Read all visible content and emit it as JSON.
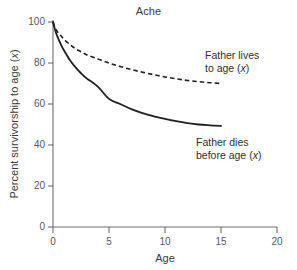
{
  "chart_data": {
    "type": "line",
    "title": "Ache",
    "xlabel": "Age",
    "ylabel": "Percent survivorship to age (x)",
    "xlim": [
      0,
      20
    ],
    "ylim": [
      0,
      100
    ],
    "xticks": [
      0,
      5,
      10,
      15,
      20
    ],
    "yticks": [
      0,
      20,
      40,
      60,
      80,
      100
    ],
    "xtick_labels": [
      "0",
      "5",
      "10",
      "15",
      "20"
    ],
    "ytick_labels": [
      "0",
      "20",
      "40",
      "60",
      "80",
      "100"
    ],
    "grid": false,
    "legend_position": "inline-annotations",
    "series": [
      {
        "name": "Father lives to age (x)",
        "style": "dashed",
        "color": "#231f20",
        "x": [
          0,
          0.25,
          0.5,
          0.75,
          1,
          1.5,
          2,
          2.5,
          3,
          4,
          5,
          6,
          7,
          8,
          9,
          10,
          11,
          12,
          13,
          14,
          15
        ],
        "values": [
          100,
          96.5,
          94.5,
          93,
          91.5,
          89,
          87,
          85.5,
          84,
          82,
          80,
          78.3,
          76.8,
          75.5,
          74.3,
          73.2,
          72.3,
          71.5,
          70.9,
          70.4,
          70
        ]
      },
      {
        "name": "Father dies before age (x)",
        "style": "solid",
        "color": "#231f20",
        "x": [
          0,
          0.25,
          0.5,
          0.75,
          1,
          1.5,
          2,
          2.5,
          3,
          4,
          5,
          6,
          7,
          8,
          9,
          10,
          11,
          12,
          13,
          14,
          15
        ],
        "values": [
          100,
          95,
          91.5,
          88.5,
          86,
          81.5,
          78,
          75,
          72.5,
          68.5,
          62.5,
          60,
          57.5,
          55.5,
          54,
          52.7,
          51.6,
          50.7,
          50,
          49.6,
          49.3
        ]
      }
    ],
    "annotations": [
      {
        "id": "annotation-father-lives",
        "line1": "Father lives",
        "line2_prefix": "to age (",
        "line2_italic": "x",
        "line2_suffix": ")"
      },
      {
        "id": "annotation-father-dies",
        "line1": "Father dies",
        "line2_prefix": "before age (",
        "line2_italic": "x",
        "line2_suffix": ")"
      }
    ],
    "ylabel_parts": {
      "prefix": "Percent survivorship to age (",
      "italic": "x",
      "suffix": ")"
    }
  },
  "caption_strip": {
    "text": " "
  }
}
